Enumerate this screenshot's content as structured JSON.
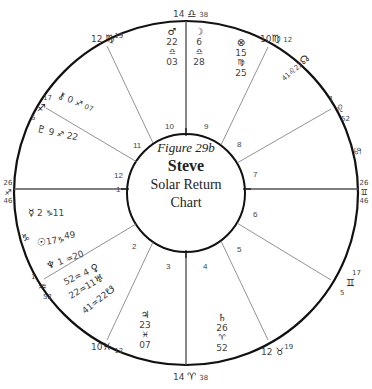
{
  "title": {
    "figure": "Figure 29b",
    "name": "Steve",
    "line1": "Solar Return",
    "line2": "Chart"
  },
  "cusps": [
    {
      "house": 10,
      "deg": "14",
      "sign": "♎",
      "min": "38"
    },
    {
      "house": 11,
      "deg": "10",
      "sign": "♍",
      "min": "12"
    },
    {
      "house": 12,
      "deg": "1",
      "sign": "♌",
      "min": "52"
    },
    {
      "house": 1,
      "deg": "26",
      "sign": "♋",
      "min": "46"
    },
    {
      "house": 2,
      "deg": "17",
      "sign": "♊",
      "min": "5"
    },
    {
      "house": 3,
      "deg": "12",
      "sign": "♉",
      "min": "19"
    },
    {
      "house": 4,
      "deg": "14",
      "sign": "♈",
      "min": "38"
    },
    {
      "house": 5,
      "deg": "10",
      "sign": "♓",
      "min": "12"
    },
    {
      "house": 6,
      "deg": "1",
      "sign": "♒",
      "min": "52"
    },
    {
      "house": 7,
      "deg": "26",
      "sign": "♐",
      "min": "46"
    },
    {
      "house": 8,
      "deg": "17",
      "sign": "♐",
      "min": "5"
    },
    {
      "house": 9,
      "deg": "12",
      "sign": "♍",
      "min": "19"
    }
  ],
  "cusp_labels": {
    "top": {
      "deg": "14",
      "sign": "♎",
      "min": "38"
    },
    "bottom": {
      "deg": "14",
      "sign": "♈",
      "min": "38"
    },
    "left": {
      "deg": "26",
      "sign": "♐",
      "min": "46"
    },
    "right": {
      "deg": "26",
      "sign": "♊",
      "min": "46"
    },
    "top_left": {
      "deg": "12",
      "sign": "♍",
      "min": "19"
    },
    "top_right": {
      "deg": "10",
      "sign": "♍",
      "min": "12"
    },
    "right_upper": {
      "deg": "1",
      "sign": "♌",
      "min": "52"
    },
    "right_lower": {
      "deg": "5",
      "sign": "♊",
      "min": "17"
    },
    "bottom_right": {
      "deg": "12",
      "sign": "♉",
      "min": "19"
    },
    "bottom_left": {
      "deg": "10",
      "sign": "♓",
      "min": "12"
    },
    "left_lower": {
      "deg": "1",
      "sign": "♒",
      "min": "52"
    },
    "left_upper": {
      "deg": "5",
      "sign": "♐",
      "min": "17"
    },
    "intercepted_right_top": "♋",
    "intercepted_left_bottom": "♑"
  },
  "house_numbers": [
    "1",
    "2",
    "3",
    "4",
    "5",
    "6",
    "7",
    "8",
    "9",
    "10",
    "11",
    "12"
  ],
  "planets": {
    "mars": {
      "glyph": "♂",
      "deg": "22",
      "sign": "♎",
      "min": "03"
    },
    "moon": {
      "glyph": "☽",
      "deg": "6",
      "sign": "♎",
      "min": "28"
    },
    "fortune": {
      "glyph": "⊗",
      "deg": "15",
      "sign": "♍",
      "min": "25"
    },
    "north_node": {
      "glyph": "☊",
      "deg": "22",
      "sign": "♌",
      "min": "41"
    },
    "chiron": {
      "glyph": "⚷",
      "deg": "0",
      "sign": "♐",
      "min": "07"
    },
    "pluto": {
      "glyph": "♇",
      "deg": "9",
      "sign": "♐",
      "min": "22"
    },
    "mercury": {
      "glyph": "☿",
      "deg": "2",
      "sign": "♑",
      "min": "11"
    },
    "sun": {
      "glyph": "☉",
      "deg": "17",
      "sign": "♑",
      "min": "49"
    },
    "neptune": {
      "glyph": "♆",
      "deg": "1",
      "sign": "♒",
      "min": "20"
    },
    "venus": {
      "glyph": "♀",
      "deg": "4",
      "sign": "♒",
      "min": "52"
    },
    "uranus": {
      "glyph": "♅",
      "deg": "11",
      "sign": "♒",
      "min": "22"
    },
    "south_node": {
      "glyph": "☋",
      "deg": "22",
      "sign": "♒",
      "min": "41"
    },
    "jupiter": {
      "glyph": "♃",
      "deg": "23",
      "sign": "♓",
      "min": "07"
    },
    "saturn": {
      "glyph": "♄",
      "deg": "26",
      "sign": "♈",
      "min": "52"
    }
  }
}
